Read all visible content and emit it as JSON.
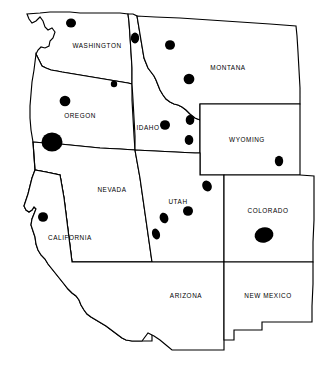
{
  "map": {
    "title": "Western United States distribution map",
    "region_name": "Western United States",
    "background_color": "#ffffff",
    "outline_color": "#000000",
    "marker_color": "#000000",
    "projection_note": "plain outline map, no graticule, no legend, no scale bar",
    "states": [
      {
        "id": "washington",
        "label": "WASHINGTON",
        "label_x": 97,
        "label_y": 46,
        "outline": "M 27,14 L 29,19 L 32,23 L 36,21 L 40,17 L 43,21 L 45,27 L 48,30 L 52,28 L 55,32 L 53,38 L 50,41 L 49,46 L 45,48 L 41,47 L 38,50 L 36,54 L 38,58 L 40,62 L 42,66 L 46,68 L 51,70 L 57,71 L 62,72 L 68,73 L 74,74 L 80,75 L 86,76 L 92,77 L 98,78 L 104,79 L 110,80 L 116,81 L 122,82 L 128,83 L 132,84 L 132,68 L 131,52 L 130,36 L 129,22 L 128,14 L 120,13 L 110,13 L 100,13 L 90,13 L 80,13 L 70,12 L 60,12 L 50,12 L 40,13 Z"
      },
      {
        "id": "oregon",
        "label": "OREGON",
        "label_x": 80,
        "label_y": 116,
        "outline": "M 36,54 L 38,58 L 40,62 L 42,66 L 46,68 L 51,70 L 57,71 L 62,72 L 68,73 L 74,74 L 80,75 L 86,76 L 92,77 L 98,78 L 104,79 L 110,80 L 116,81 L 122,82 L 128,83 L 132,84 L 132,100 L 133,118 L 134,136 L 135,150 L 120,149 L 100,148 L 80,146 L 60,144 L 45,143 L 33,142 L 31,130 L 30,118 L 30,106 L 31,94 L 32,82 L 34,70 Z"
      },
      {
        "id": "idaho",
        "label": "IDAHO",
        "label_x": 148,
        "label_y": 128,
        "outline": "M 128,14 L 129,22 L 130,36 L 131,52 L 132,68 L 132,84 L 133,100 L 134,118 L 135,136 L 135,150 L 155,151 L 175,152 L 195,153 L 200,153 L 200,137 L 200,120 L 195,118 L 190,114 L 186,110 L 182,107 L 178,105 L 174,104 L 170,102 L 166,99 L 163,95 L 160,90 L 158,85 L 156,80 L 154,76 L 151,72 L 148,68 L 146,63 L 144,58 L 143,52 L 142,46 L 141,40 L 140,34 L 139,28 L 138,22 L 137,16 L 133,14 Z"
      },
      {
        "id": "montana",
        "label": "MONTANA",
        "label_x": 228,
        "label_y": 68,
        "outline": "M 137,16 L 138,22 L 139,28 L 140,34 L 141,40 L 142,46 L 143,52 L 144,58 L 146,63 L 148,68 L 151,72 L 154,76 L 156,80 L 158,85 L 160,90 L 163,95 L 166,99 L 170,102 L 174,104 L 178,105 L 182,107 L 186,110 L 190,114 L 195,118 L 200,120 L 200,104 L 222,104 L 250,104 L 278,104 L 300,104 L 300,88 L 299,70 L 298,52 L 297,36 L 296,26 L 270,24 L 240,22 L 210,20 L 180,18 L 155,17 Z"
      },
      {
        "id": "wyoming",
        "label": "WYOMING",
        "label_x": 247,
        "label_y": 140,
        "outline": "M 200,104 L 222,104 L 250,104 L 278,104 L 300,104 L 300,128 L 300,152 L 300,175 L 276,175 L 250,175 L 224,175 L 200,175 L 200,152 L 200,128 Z"
      },
      {
        "id": "nevada",
        "label": "NEVADA",
        "label_x": 112,
        "label_y": 190,
        "outline": "M 33,142 L 45,143 L 60,144 L 80,146 L 100,148 L 120,149 L 135,150 L 140,178 L 144,206 L 148,234 L 152,262 L 130,262 L 108,262 L 86,262 L 72,262 L 68,230 L 64,198 L 60,175 L 46,172 L 35,170 L 34,156 Z"
      },
      {
        "id": "utah",
        "label": "UTAH",
        "label_x": 178,
        "label_y": 202,
        "outline": "M 135,150 L 155,151 L 175,152 L 195,153 L 200,153 L 200,175 L 224,175 L 224,196 L 224,218 L 224,240 L 224,262 L 200,262 L 176,262 L 152,262 L 148,234 L 144,206 L 140,178 Z"
      },
      {
        "id": "colorado",
        "label": "COLORADO",
        "label_x": 268,
        "label_y": 211,
        "outline": "M 224,175 L 250,175 L 276,175 L 300,175 L 314,176 L 314,198 L 314,220 L 313,242 L 313,262 L 290,262 L 266,262 L 242,262 L 224,262 L 224,240 L 224,218 L 224,196 Z"
      },
      {
        "id": "california",
        "label": "CALIFORNIA",
        "label_x": 70,
        "label_y": 238,
        "outline": "M 33,142 L 34,156 L 35,170 L 32,178 L 30,186 L 28,194 L 26,200 L 24,206 L 26,210 L 29,212 L 32,210 L 34,207 L 36,209 L 34,214 L 32,219 L 31,225 L 33,231 L 35,237 L 36,244 L 38,250 L 41,255 L 45,259 L 48,264 L 52,269 L 56,274 L 60,279 L 64,284 L 68,289 L 72,293 L 76,296 L 79,300 L 81,305 L 84,310 L 87,314 L 91,317 L 96,320 L 101,323 L 106,326 L 110,329 L 114,332 L 118,335 L 122,338 L 126,340 L 132,341 L 138,341 L 145,341 L 152,341 L 152,320 L 152,300 L 152,280 L 152,262 L 130,262 L 108,262 L 86,262 L 72,262 L 68,230 L 64,198 L 60,175 L 46,172 L 35,170 Z"
      },
      {
        "id": "arizona",
        "label": "ARIZONA",
        "label_x": 186,
        "label_y": 296,
        "outline": "M 152,262 L 176,262 L 200,262 L 224,262 L 224,284 L 224,306 L 224,328 L 224,350 L 212,350 L 198,350 L 184,350 L 172,350 L 166,345 L 160,340 L 154,336 L 148,333 L 142,341 L 138,341 L 132,341 L 126,340 L 122,338 L 118,335 L 114,332 L 110,329 L 106,326 L 101,323 L 96,320 L 91,317 L 87,314 L 84,310 L 81,305 L 79,300 L 76,296 L 72,293 L 68,289 L 64,284 L 60,279 L 56,274 L 52,269 L 48,264 L 45,259 L 41,255 L 38,250 L 36,244 L 35,237 L 33,231 L 31,225 L 32,219 L 34,214 L 36,209 L 34,207 L 32,210 L 29,212 L 26,210 L 24,206 L 26,200 L 28,194 L 30,186 L 32,178 L 35,170 L 46,172 L 60,175 L 64,198 L 68,230 L 72,262 Z"
      },
      {
        "id": "new-mexico",
        "label": "NEW MEXICO",
        "label_x": 268,
        "label_y": 296,
        "outline": "M 224,262 L 242,262 L 266,262 L 290,262 L 313,262 L 313,284 L 312,306 L 312,322 L 296,322 L 280,322 L 264,322 L 262,322 L 262,330 L 248,330 L 234,330 L 234,340 L 224,340 L 224,328 L 224,306 L 224,284 Z"
      }
    ],
    "marker_legend_note": "filled black ellipses representing occurrence localities; size varies with record count",
    "markers": [
      {
        "id": "m01",
        "state": "washington",
        "cx": 71,
        "cy": 23,
        "rx": 5.0,
        "ry": 4.6,
        "rotate": 0,
        "size_class": "medium"
      },
      {
        "id": "m02",
        "state": "washington",
        "cx": 135,
        "cy": 38,
        "rx": 4.2,
        "ry": 5.4,
        "rotate": 0,
        "size_class": "medium"
      },
      {
        "id": "m03",
        "state": "montana",
        "cx": 170,
        "cy": 45,
        "rx": 5.0,
        "ry": 4.8,
        "rotate": 0,
        "size_class": "medium"
      },
      {
        "id": "m04",
        "state": "montana",
        "cx": 189,
        "cy": 79,
        "rx": 5.4,
        "ry": 5.2,
        "rotate": 0,
        "size_class": "medium"
      },
      {
        "id": "m05",
        "state": "oregon",
        "cx": 114,
        "cy": 84,
        "rx": 3.2,
        "ry": 3.2,
        "rotate": 0,
        "size_class": "small"
      },
      {
        "id": "m06",
        "state": "oregon",
        "cx": 65,
        "cy": 101,
        "rx": 5.4,
        "ry": 5.2,
        "rotate": 0,
        "size_class": "medium"
      },
      {
        "id": "m07",
        "state": "oregon",
        "cx": 52,
        "cy": 142,
        "rx": 10.5,
        "ry": 9.5,
        "rotate": 0,
        "size_class": "extra-large"
      },
      {
        "id": "m08",
        "state": "idaho",
        "cx": 165,
        "cy": 125,
        "rx": 5.0,
        "ry": 4.8,
        "rotate": 0,
        "size_class": "medium"
      },
      {
        "id": "m09",
        "state": "idaho",
        "cx": 190,
        "cy": 120,
        "rx": 4.3,
        "ry": 5.0,
        "rotate": 0,
        "size_class": "medium"
      },
      {
        "id": "m10",
        "state": "idaho",
        "cx": 189,
        "cy": 140,
        "rx": 4.3,
        "ry": 5.0,
        "rotate": 0,
        "size_class": "medium"
      },
      {
        "id": "m11",
        "state": "wyoming",
        "cx": 279,
        "cy": 161,
        "rx": 4.2,
        "ry": 5.2,
        "rotate": 0,
        "size_class": "medium"
      },
      {
        "id": "m12",
        "state": "utah",
        "cx": 207,
        "cy": 186,
        "rx": 4.6,
        "ry": 5.6,
        "rotate": -28,
        "size_class": "medium"
      },
      {
        "id": "m13",
        "state": "utah",
        "cx": 188,
        "cy": 211,
        "rx": 5.0,
        "ry": 4.8,
        "rotate": 0,
        "size_class": "medium"
      },
      {
        "id": "m14",
        "state": "utah",
        "cx": 164,
        "cy": 218,
        "rx": 4.3,
        "ry": 5.4,
        "rotate": -18,
        "size_class": "medium"
      },
      {
        "id": "m15",
        "state": "utah",
        "cx": 156,
        "cy": 234,
        "rx": 3.9,
        "ry": 5.6,
        "rotate": -18,
        "size_class": "medium"
      },
      {
        "id": "m16",
        "state": "california",
        "cx": 43,
        "cy": 217,
        "rx": 5.0,
        "ry": 4.8,
        "rotate": 0,
        "size_class": "medium"
      },
      {
        "id": "m17",
        "state": "colorado",
        "cx": 264,
        "cy": 235,
        "rx": 9.5,
        "ry": 7.6,
        "rotate": -12,
        "size_class": "large"
      }
    ]
  }
}
